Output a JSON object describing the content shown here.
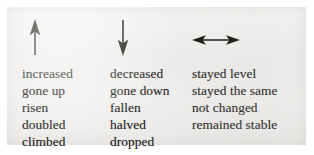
{
  "figure": {
    "background_color": "#f1f0ee",
    "text_color": "#1b1a19",
    "ink_color": "#15140f"
  },
  "columns": [
    {
      "id": "increase",
      "icon": "arrow-up-icon",
      "icon_label": "up arrow",
      "words": [
        "increased",
        "gone up",
        "risen",
        "doubled",
        "climbed"
      ]
    },
    {
      "id": "decrease",
      "icon": "arrow-down-icon",
      "icon_label": "down arrow",
      "words": [
        "decreased",
        "gone down",
        "fallen",
        "halved",
        "dropped"
      ]
    },
    {
      "id": "no-change",
      "icon": "arrow-left-right-icon",
      "icon_label": "double-headed horizontal arrow",
      "words": [
        "stayed level",
        "stayed the same",
        "not changed",
        "remained stable"
      ]
    }
  ]
}
